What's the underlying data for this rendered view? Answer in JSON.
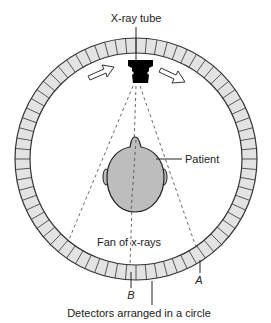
{
  "diagram": {
    "labels": {
      "tube": "X-ray tube",
      "patient": "Patient",
      "fan": "Fan of x-rays",
      "detector_a": "A",
      "detector_b": "B",
      "detectors": "Detectors arranged in a circle"
    },
    "ring": {
      "center": [
        136,
        159
      ],
      "outer_radius": 121,
      "inner_radius": 106,
      "segments": 72,
      "fill": "#e3e3e3",
      "stroke": "#333333"
    },
    "head": {
      "fill": "#bdbdbd",
      "stroke": "#222222"
    },
    "tube_color": "#000000",
    "rotation_arrows": [
      "left-arrow",
      "right-arrow"
    ]
  }
}
